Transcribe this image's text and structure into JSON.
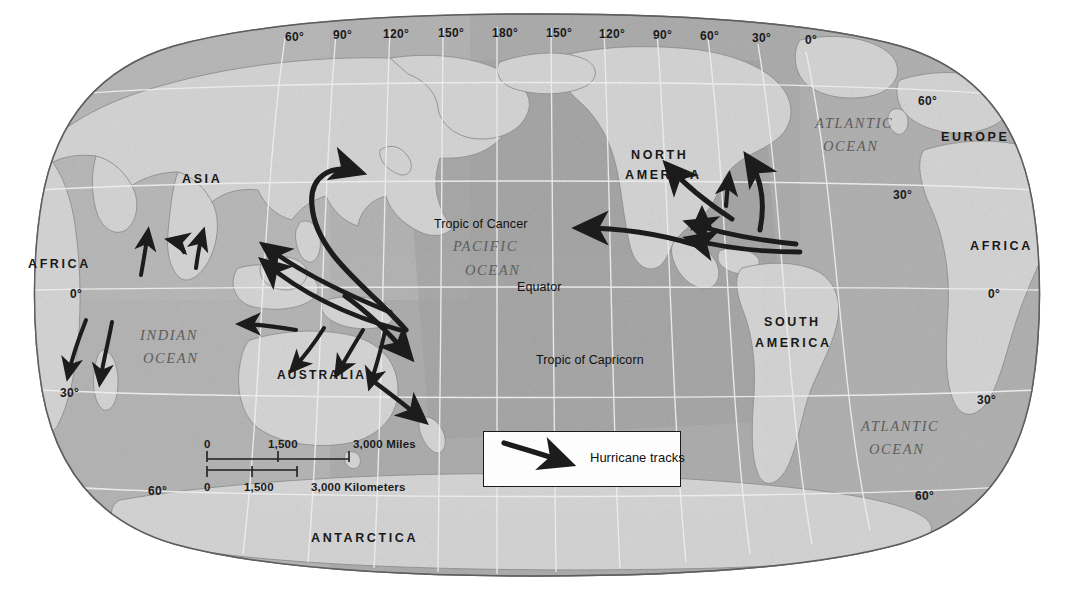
{
  "map": {
    "title": "World map of hurricane tracks",
    "projection": "oval world projection",
    "background_color": "#ffffff",
    "ocean_color": "#a9a9a9",
    "land_color": "#d2d2d2",
    "graticule_color": "#f2f2f2",
    "track_color": "#1a1a1a"
  },
  "longitude_labels": [
    {
      "text": "60°",
      "x": 285,
      "y": 30
    },
    {
      "text": "90°",
      "x": 333,
      "y": 28
    },
    {
      "text": "120°",
      "x": 383,
      "y": 27
    },
    {
      "text": "150°",
      "x": 438,
      "y": 26
    },
    {
      "text": "180°",
      "x": 492,
      "y": 26
    },
    {
      "text": "150°",
      "x": 546,
      "y": 26
    },
    {
      "text": "120°",
      "x": 599,
      "y": 27
    },
    {
      "text": "90°",
      "x": 653,
      "y": 28
    },
    {
      "text": "60°",
      "x": 700,
      "y": 29
    },
    {
      "text": "30°",
      "x": 752,
      "y": 31
    },
    {
      "text": "0°",
      "x": 805,
      "y": 33
    }
  ],
  "latitude_labels": [
    {
      "text": "60°",
      "x": 918,
      "y": 94,
      "side": "right"
    },
    {
      "text": "30°",
      "x": 893,
      "y": 188,
      "side": "right"
    },
    {
      "text": "0°",
      "x": 988,
      "y": 287,
      "side": "right"
    },
    {
      "text": "30°",
      "x": 977,
      "y": 393,
      "side": "right"
    },
    {
      "text": "60°",
      "x": 915,
      "y": 489,
      "side": "right"
    },
    {
      "text": "0°",
      "x": 70,
      "y": 287,
      "side": "left"
    },
    {
      "text": "30°",
      "x": 60,
      "y": 386,
      "side": "left"
    },
    {
      "text": "60°",
      "x": 148,
      "y": 484,
      "side": "left"
    }
  ],
  "continents": [
    {
      "name": "ASIA",
      "x": 182,
      "y": 172,
      "size": "large"
    },
    {
      "name": "AFRICA",
      "x": 28,
      "y": 257,
      "size": "large"
    },
    {
      "name": "AUSTRALIA",
      "x": 277,
      "y": 368,
      "size": "small"
    },
    {
      "name": "ANTARCTICA",
      "x": 311,
      "y": 531,
      "size": "large"
    },
    {
      "name": "NORTH",
      "x": 631,
      "y": 148,
      "size": "large"
    },
    {
      "name": "AMERICA",
      "x": 625,
      "y": 168,
      "size": "large"
    },
    {
      "name": "SOUTH",
      "x": 764,
      "y": 315,
      "size": "large"
    },
    {
      "name": "AMERICA",
      "x": 755,
      "y": 336,
      "size": "large"
    },
    {
      "name": "EUROPE",
      "x": 941,
      "y": 130,
      "size": "large"
    },
    {
      "name": "AFRICA",
      "x": 970,
      "y": 239,
      "size": "large"
    }
  ],
  "oceans": [
    {
      "name": "PACIFIC",
      "x": 453,
      "y": 238
    },
    {
      "name": "OCEAN",
      "x": 465,
      "y": 262
    },
    {
      "name": "INDIAN",
      "x": 140,
      "y": 327
    },
    {
      "name": "OCEAN",
      "x": 143,
      "y": 350
    },
    {
      "name": "ATLANTIC",
      "x": 815,
      "y": 115
    },
    {
      "name": "OCEAN",
      "x": 823,
      "y": 138
    },
    {
      "name": "ATLANTIC",
      "x": 861,
      "y": 418
    },
    {
      "name": "OCEAN",
      "x": 869,
      "y": 441
    }
  ],
  "annotations": [
    {
      "text": "Tropic of Cancer",
      "x": 434,
      "y": 217
    },
    {
      "text": "Equator",
      "x": 517,
      "y": 280
    },
    {
      "text": "Tropic of Capricorn",
      "x": 536,
      "y": 353
    }
  ],
  "scale_bar": {
    "miles": {
      "labels": [
        "0",
        "1,500",
        "3,000 Miles"
      ],
      "label_x": [
        204,
        268,
        353
      ],
      "label_y": 438,
      "bar_left": 207,
      "bar_right": 349,
      "bar_y": 459,
      "tick_mid": 278
    },
    "kilometers": {
      "labels": [
        "0",
        "1,500",
        "3,000 Kilometers"
      ],
      "label_x": [
        204,
        244,
        311
      ],
      "label_y": 481,
      "bar_left": 207,
      "bar_right": 297,
      "bar_y": 470,
      "tick_mid": 252
    }
  },
  "legend": {
    "label": "Hurricane tracks",
    "icon": "hurricane-track-arrow-icon",
    "box": {
      "x": 483,
      "y": 431,
      "w": 198,
      "h": 56
    },
    "border_color": "#1b1b1b",
    "fill_color": "#fdfdfd"
  },
  "hurricane_tracks": [
    {
      "id": "nw-pacific-1",
      "region": "Northwest Pacific",
      "direction": "northeast"
    },
    {
      "id": "nw-pacific-2",
      "region": "Northwest Pacific",
      "direction": "northwest"
    },
    {
      "id": "nw-pacific-3",
      "region": "Northwest Pacific",
      "direction": "northwest"
    },
    {
      "id": "bay-of-bengal",
      "region": "Bay of Bengal",
      "direction": "north"
    },
    {
      "id": "arabian-sea",
      "region": "Arabian Sea",
      "direction": "north"
    },
    {
      "id": "arabian-sea-2",
      "region": "Arabian Sea",
      "direction": "northwest"
    },
    {
      "id": "sw-indian-1",
      "region": "Southwest Indian Ocean",
      "direction": "southwest"
    },
    {
      "id": "sw-indian-2",
      "region": "Southwest Indian Ocean",
      "direction": "south"
    },
    {
      "id": "ne-australia-1",
      "region": "Coral Sea",
      "direction": "west"
    },
    {
      "id": "ne-australia-2",
      "region": "Coral Sea",
      "direction": "southwest"
    },
    {
      "id": "ne-australia-3",
      "region": "Coral Sea",
      "direction": "south"
    },
    {
      "id": "s-pacific-1",
      "region": "South Pacific",
      "direction": "southeast"
    },
    {
      "id": "s-pacific-2",
      "region": "South Pacific",
      "direction": "southeast"
    },
    {
      "id": "ne-pacific-1",
      "region": "Northeast Pacific",
      "direction": "northwest"
    },
    {
      "id": "atlantic-1",
      "region": "North Atlantic",
      "direction": "northeast"
    },
    {
      "id": "atlantic-2",
      "region": "Caribbean",
      "direction": "north"
    },
    {
      "id": "atlantic-3",
      "region": "Caribbean",
      "direction": "west"
    },
    {
      "id": "atlantic-4",
      "region": "Caribbean",
      "direction": "west"
    },
    {
      "id": "atlantic-5",
      "region": "Gulf of Mexico",
      "direction": "northwest"
    }
  ]
}
